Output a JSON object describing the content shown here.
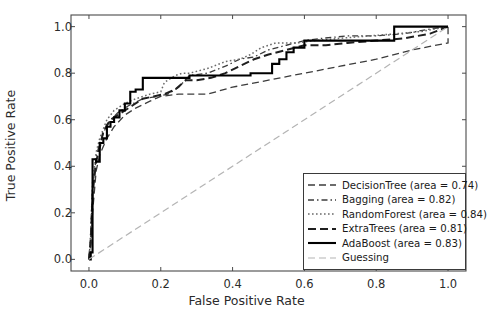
{
  "chart_data": {
    "type": "line",
    "title": "",
    "xlabel": "False Positive Rate",
    "ylabel": "True Positive Rate",
    "xlim": [
      -0.05,
      1.05
    ],
    "ylim": [
      -0.05,
      1.05
    ],
    "xticks": [
      "0.0",
      "0.2",
      "0.4",
      "0.6",
      "0.8",
      "1.0"
    ],
    "xtick_values": [
      0.0,
      0.2,
      0.4,
      0.6,
      0.8,
      1.0
    ],
    "yticks": [
      "0.0",
      "0.2",
      "0.4",
      "0.6",
      "0.8",
      "1.0"
    ],
    "ytick_values": [
      0.0,
      0.2,
      0.4,
      0.6,
      0.8,
      1.0
    ],
    "grid": false,
    "legend_position": "lower right",
    "series": [
      {
        "name": "DecisionTree",
        "area": 0.74,
        "label": "DecisionTree (area = 0.74)",
        "style": "dashed",
        "color": "#3c3c3c",
        "width": 1.3,
        "dash": "7,4",
        "x": [
          0.0,
          0.005,
          0.01,
          0.02,
          0.03,
          0.05,
          0.07,
          0.1,
          0.13,
          0.17,
          0.2,
          0.25,
          0.33,
          0.4,
          0.5,
          0.6,
          0.7,
          0.8,
          0.9,
          1.0,
          1.0
        ],
        "y": [
          0.0,
          0.06,
          0.2,
          0.38,
          0.45,
          0.52,
          0.57,
          0.62,
          0.65,
          0.68,
          0.7,
          0.71,
          0.71,
          0.74,
          0.77,
          0.8,
          0.83,
          0.86,
          0.9,
          0.93,
          1.0
        ]
      },
      {
        "name": "Bagging",
        "area": 0.82,
        "label": "Bagging (area = 0.82)",
        "style": "dashdot",
        "color": "#3c3c3c",
        "width": 1.3,
        "dash": "6,3,1.5,3",
        "x": [
          0.0,
          0.005,
          0.01,
          0.02,
          0.03,
          0.05,
          0.08,
          0.11,
          0.15,
          0.19,
          0.22,
          0.25,
          0.28,
          0.33,
          0.38,
          0.42,
          0.46,
          0.5,
          0.55,
          0.6,
          0.65,
          0.72,
          0.8,
          0.88,
          0.95,
          1.0
        ],
        "y": [
          0.0,
          0.1,
          0.3,
          0.44,
          0.5,
          0.58,
          0.63,
          0.66,
          0.69,
          0.7,
          0.71,
          0.74,
          0.79,
          0.8,
          0.83,
          0.86,
          0.87,
          0.9,
          0.92,
          0.94,
          0.95,
          0.96,
          0.96,
          0.97,
          0.99,
          1.0
        ]
      },
      {
        "name": "RandomForest",
        "area": 0.84,
        "label": "RandomForest (area = 0.84)",
        "style": "dotted",
        "color": "#6a6a6a",
        "width": 1.5,
        "dash": "1.6,2.4",
        "x": [
          0.0,
          0.005,
          0.01,
          0.02,
          0.03,
          0.05,
          0.07,
          0.1,
          0.13,
          0.17,
          0.2,
          0.21,
          0.24,
          0.26,
          0.28,
          0.33,
          0.38,
          0.42,
          0.45,
          0.48,
          0.52,
          0.58,
          0.63,
          0.7,
          0.78,
          0.86,
          0.93,
          1.0
        ],
        "y": [
          0.0,
          0.12,
          0.33,
          0.46,
          0.52,
          0.6,
          0.64,
          0.67,
          0.69,
          0.71,
          0.72,
          0.76,
          0.79,
          0.8,
          0.8,
          0.82,
          0.85,
          0.86,
          0.88,
          0.91,
          0.93,
          0.93,
          0.94,
          0.95,
          0.96,
          0.97,
          0.98,
          1.0
        ]
      },
      {
        "name": "ExtraTrees",
        "area": 0.81,
        "label": "ExtraTrees (area = 0.81)",
        "style": "dashed-bold",
        "color": "#1f1f1f",
        "width": 2.0,
        "dash": "8,4",
        "x": [
          0.0,
          0.005,
          0.01,
          0.02,
          0.03,
          0.04,
          0.06,
          0.09,
          0.12,
          0.15,
          0.18,
          0.21,
          0.24,
          0.27,
          0.3,
          0.34,
          0.38,
          0.42,
          0.46,
          0.5,
          0.55,
          0.6,
          0.66,
          0.72,
          0.8,
          0.88,
          0.95,
          1.0
        ],
        "y": [
          0.0,
          0.08,
          0.28,
          0.42,
          0.48,
          0.55,
          0.6,
          0.63,
          0.66,
          0.69,
          0.7,
          0.71,
          0.73,
          0.77,
          0.77,
          0.78,
          0.8,
          0.83,
          0.86,
          0.88,
          0.9,
          0.92,
          0.92,
          0.93,
          0.94,
          0.95,
          0.97,
          1.0
        ]
      },
      {
        "name": "AdaBoost",
        "area": 0.83,
        "label": "AdaBoost (area = 0.83)",
        "style": "solid",
        "color": "#000000",
        "width": 2.1,
        "dash": "",
        "x": [
          0.0,
          0.005,
          0.005,
          0.01,
          0.01,
          0.02,
          0.02,
          0.03,
          0.03,
          0.04,
          0.04,
          0.05,
          0.05,
          0.06,
          0.06,
          0.07,
          0.07,
          0.085,
          0.085,
          0.1,
          0.1,
          0.115,
          0.115,
          0.13,
          0.13,
          0.15,
          0.15,
          0.28,
          0.28,
          0.45,
          0.45,
          0.51,
          0.51,
          0.53,
          0.53,
          0.55,
          0.55,
          0.57,
          0.57,
          0.6,
          0.6,
          0.85,
          0.85,
          1.0
        ],
        "y": [
          0.0,
          0.0,
          0.03,
          0.03,
          0.43,
          0.43,
          0.42,
          0.42,
          0.5,
          0.5,
          0.52,
          0.52,
          0.57,
          0.57,
          0.59,
          0.59,
          0.61,
          0.61,
          0.64,
          0.64,
          0.67,
          0.67,
          0.72,
          0.72,
          0.73,
          0.73,
          0.78,
          0.78,
          0.79,
          0.79,
          0.8,
          0.8,
          0.84,
          0.84,
          0.86,
          0.86,
          0.89,
          0.89,
          0.91,
          0.91,
          0.94,
          0.94,
          1.0,
          1.0
        ]
      },
      {
        "name": "Guessing",
        "area": null,
        "label": "Guessing",
        "style": "dashed-light",
        "color": "#b4b4b4",
        "width": 1.2,
        "dash": "7,4",
        "x": [
          0.0,
          1.0
        ],
        "y": [
          0.0,
          1.0
        ]
      }
    ]
  },
  "axes": {
    "frame_color": "#4a4a4a",
    "tick_color": "#4a4a4a"
  }
}
